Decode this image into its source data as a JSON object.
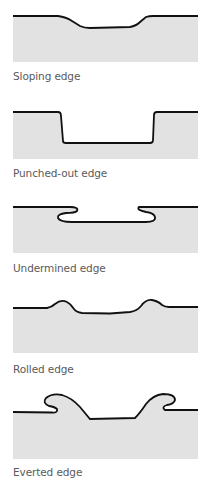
{
  "colors": {
    "tissue_fill": "#e2e2e2",
    "edge_stroke": "#111111",
    "label_text": "#5a5a5a",
    "background": "#ffffff"
  },
  "diagrams": [
    {
      "id": "sloping",
      "label": "Sloping edge"
    },
    {
      "id": "punched-out",
      "label": "Punched-out edge"
    },
    {
      "id": "undermined",
      "label": "Undermined edge"
    },
    {
      "id": "rolled",
      "label": "Rolled edge"
    },
    {
      "id": "everted",
      "label": "Everted edge"
    }
  ]
}
